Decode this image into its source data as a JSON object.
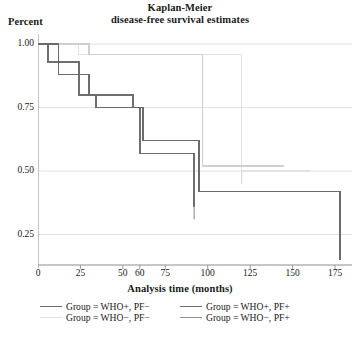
{
  "chart_data": {
    "type": "line",
    "subtype": "kaplan-meier-step",
    "title": "Kaplan-Meier",
    "subtitle": "disease-free survival estimates",
    "ylabel": "Percent",
    "xlabel": "Analysis time (months)",
    "xlim": [
      0,
      185
    ],
    "ylim": [
      0.13,
      1.04
    ],
    "grid": "horizontal",
    "legend_position": "bottom",
    "yticks": [
      0.25,
      0.5,
      0.75,
      1.0
    ],
    "ytick_labels": [
      "0.25",
      "0.50",
      "0.75",
      "1.00"
    ],
    "xticks": [
      0,
      25,
      50,
      60,
      75,
      100,
      125,
      150,
      175
    ],
    "xtick_labels": [
      "0",
      "25",
      "50",
      "60",
      "75",
      "100",
      "125",
      "150",
      "175"
    ],
    "series": [
      {
        "name": "Group = WHO+, PF-",
        "color": "#6b6b6b",
        "width": 1.7,
        "points": [
          [
            0,
            1.0
          ],
          [
            12,
            1.0
          ],
          [
            12,
            0.88
          ],
          [
            30,
            0.88
          ],
          [
            30,
            0.8
          ],
          [
            34,
            0.8
          ],
          [
            34,
            0.75
          ],
          [
            62,
            0.75
          ],
          [
            62,
            0.62
          ],
          [
            95,
            0.62
          ],
          [
            95,
            0.42
          ],
          [
            178,
            0.42
          ],
          [
            178,
            0.15
          ]
        ]
      },
      {
        "name": "Group = WHO+, PF+",
        "color": "#6e6e6e",
        "width": 1.6,
        "points": [
          [
            0,
            1.0
          ],
          [
            6,
            1.0
          ],
          [
            6,
            0.93
          ],
          [
            24,
            0.93
          ],
          [
            24,
            0.8
          ],
          [
            56,
            0.8
          ],
          [
            56,
            0.75
          ],
          [
            60,
            0.75
          ],
          [
            60,
            0.57
          ],
          [
            92,
            0.57
          ],
          [
            92,
            0.36
          ]
        ]
      },
      {
        "name": "Group = WHO-, PF-",
        "color": "#e2e2e2",
        "width": 1.5,
        "points": [
          [
            0,
            1.0
          ],
          [
            24,
            1.0
          ],
          [
            24,
            0.96
          ],
          [
            120,
            0.96
          ],
          [
            120,
            0.5
          ],
          [
            160,
            0.5
          ]
        ]
      },
      {
        "name": "Group = WHO-, PF+",
        "color": "#cfcfcf",
        "width": 1.5,
        "points": [
          [
            0,
            1.0
          ],
          [
            30,
            1.0
          ],
          [
            30,
            0.96
          ],
          [
            97,
            0.96
          ],
          [
            97,
            0.52
          ],
          [
            145,
            0.52
          ]
        ]
      }
    ],
    "censor_marks": [
      {
        "x": 92,
        "y": 0.36,
        "color": "#9a9a9a"
      },
      {
        "x": 120,
        "y": 0.5,
        "color": "#d8d8d8"
      }
    ]
  },
  "legend": {
    "rows": [
      [
        {
          "label": "Group = WHO+, PF−",
          "color": "#6b6b6b"
        },
        {
          "label": "Group = WHO+, PF+",
          "color": "#6e6e6e"
        }
      ],
      [
        {
          "label": "Group = WHO−, PF−",
          "color": "#e0e0e0"
        },
        {
          "label": "Group = WHO−, PF+",
          "color": "#8d8d8d"
        }
      ]
    ]
  },
  "axis_colors": {
    "axis_line": "#8c8c8c",
    "gridline": "#dcdcdc",
    "tick": "#9a9a9a"
  }
}
